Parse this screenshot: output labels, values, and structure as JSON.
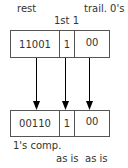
{
  "top": {
    "labels": {
      "rest": "rest",
      "first_one": "1st 1",
      "trailing": "trail. 0's"
    },
    "cells": [
      "11001",
      "1",
      "00"
    ]
  },
  "bottom": {
    "cells": [
      "00110",
      "1",
      "00"
    ],
    "labels": {
      "rest": "1's comp.",
      "first_one": "as is",
      "trailing": "as is"
    }
  },
  "colors": {
    "line": "#555555",
    "text": "#333333",
    "arrow": "#000000"
  }
}
